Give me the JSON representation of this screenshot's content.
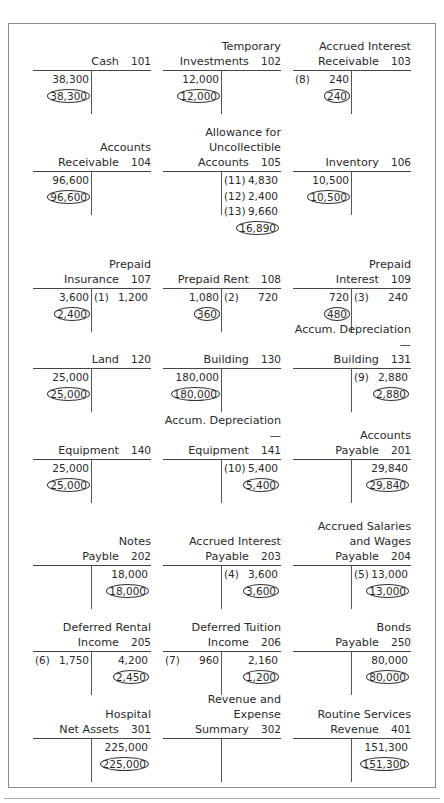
{
  "accounts": [
    {
      "name": "Cash",
      "number": "101",
      "debits": [
        {
          "ref": "",
          "amount": "38,300"
        }
      ],
      "credits": [],
      "balance": {
        "side": "debit",
        "amount": "38,300"
      }
    },
    {
      "name": "Temporary\nInvestments",
      "number": "102",
      "debits": [
        {
          "ref": "",
          "amount": "12,000"
        }
      ],
      "credits": [],
      "balance": {
        "side": "debit",
        "amount": "12,000"
      }
    },
    {
      "name": "Accrued Interest\nReceivable",
      "number": "103",
      "debits": [
        {
          "ref": "(8)",
          "amount": "240"
        }
      ],
      "credits": [],
      "balance": {
        "side": "debit",
        "amount": "240"
      }
    },
    {
      "name": "Accounts\nReceivable",
      "number": "104",
      "debits": [
        {
          "ref": "",
          "amount": "96,600"
        }
      ],
      "credits": [],
      "balance": {
        "side": "debit",
        "amount": "96,600"
      }
    },
    {
      "name": "Allowance for\nUncollectible\nAccounts",
      "number": "105",
      "debits": [],
      "credits": [
        {
          "ref": "(11)",
          "amount": "4,830"
        },
        {
          "ref": "(12)",
          "amount": "2,400"
        },
        {
          "ref": "(13)",
          "amount": "9,660"
        }
      ],
      "balance": {
        "side": "credit",
        "amount": "16,890"
      }
    },
    {
      "name": "Inventory",
      "number": "106",
      "debits": [
        {
          "ref": "",
          "amount": "10,500"
        }
      ],
      "credits": [],
      "balance": {
        "side": "debit",
        "amount": "10,500"
      }
    },
    {
      "name": "Prepaid\nInsurance",
      "number": "107",
      "debits": [
        {
          "ref": "",
          "amount": "3,600"
        }
      ],
      "credits": [
        {
          "ref": "(1)",
          "amount": "1,200"
        }
      ],
      "balance": {
        "side": "debit",
        "amount": "2,400"
      }
    },
    {
      "name": "Prepaid Rent",
      "number": "108",
      "debits": [
        {
          "ref": "",
          "amount": "1,080"
        }
      ],
      "credits": [
        {
          "ref": "(2)",
          "amount": "720"
        }
      ],
      "balance": {
        "side": "debit",
        "amount": "360"
      }
    },
    {
      "name": "Prepaid\nInterest",
      "number": "109",
      "debits": [
        {
          "ref": "",
          "amount": "720"
        }
      ],
      "credits": [
        {
          "ref": "(3)",
          "amount": "240"
        }
      ],
      "balance": {
        "side": "debit",
        "amount": "480"
      }
    },
    {
      "name": "Land",
      "number": "120",
      "debits": [
        {
          "ref": "",
          "amount": "25,000"
        }
      ],
      "credits": [],
      "balance": {
        "side": "debit",
        "amount": "25,000"
      }
    },
    {
      "name": "Building",
      "number": "130",
      "debits": [
        {
          "ref": "",
          "amount": "180,000"
        }
      ],
      "credits": [],
      "balance": {
        "side": "debit",
        "amount": "180,000"
      }
    },
    {
      "name": "Accum. Depreciation—\nBuilding",
      "number": "131",
      "debits": [],
      "credits": [
        {
          "ref": "(9)",
          "amount": "2,880"
        }
      ],
      "balance": {
        "side": "credit",
        "amount": "2,880"
      }
    },
    {
      "name": "Equipment",
      "number": "140",
      "debits": [
        {
          "ref": "",
          "amount": "25,000"
        }
      ],
      "credits": [],
      "balance": {
        "side": "debit",
        "amount": "25,000"
      }
    },
    {
      "name": "Accum. Depreciation—\nEquipment",
      "number": "141",
      "debits": [],
      "credits": [
        {
          "ref": "(10)",
          "amount": "5,400"
        }
      ],
      "balance": {
        "side": "credit",
        "amount": "5,400"
      }
    },
    {
      "name": "Accounts\nPayable",
      "number": "201",
      "debits": [],
      "credits": [
        {
          "ref": "",
          "amount": "29,840"
        }
      ],
      "balance": {
        "side": "credit",
        "amount": "29,840"
      }
    },
    {
      "name": "Notes\nPayble",
      "number": "202",
      "debits": [],
      "credits": [
        {
          "ref": "",
          "amount": "18,000"
        }
      ],
      "balance": {
        "side": "credit",
        "amount": "18,000"
      }
    },
    {
      "name": "Accrued Interest\nPayable",
      "number": "203",
      "debits": [],
      "credits": [
        {
          "ref": "(4)",
          "amount": "3,600"
        }
      ],
      "balance": {
        "side": "credit",
        "amount": "3,600"
      }
    },
    {
      "name": "Accrued Salaries\nand Wages\nPayable",
      "number": "204",
      "debits": [],
      "credits": [
        {
          "ref": "(5)",
          "amount": "13,000"
        }
      ],
      "balance": {
        "side": "credit",
        "amount": "13,000"
      }
    },
    {
      "name": "Deferred Rental\nIncome",
      "number": "205",
      "debits": [
        {
          "ref": "(6)",
          "amount": "1,750"
        }
      ],
      "credits": [
        {
          "ref": "",
          "amount": "4,200"
        }
      ],
      "balance": {
        "side": "credit",
        "amount": "2,450"
      }
    },
    {
      "name": "Deferred Tuition\nIncome",
      "number": "206",
      "debits": [
        {
          "ref": "(7)",
          "amount": "960"
        }
      ],
      "credits": [
        {
          "ref": "",
          "amount": "2,160"
        }
      ],
      "balance": {
        "side": "credit",
        "amount": "1,200"
      }
    },
    {
      "name": "Bonds\nPayable",
      "number": "250",
      "debits": [],
      "credits": [
        {
          "ref": "",
          "amount": "80,000"
        }
      ],
      "balance": {
        "side": "credit",
        "amount": "80,000"
      }
    },
    {
      "name": "Hospital\nNet Assets",
      "number": "301",
      "debits": [],
      "credits": [
        {
          "ref": "",
          "amount": "225,000"
        }
      ],
      "balance": {
        "side": "credit",
        "amount": "225,000"
      }
    },
    {
      "name": "Revenue and Expense\nSummary",
      "number": "302",
      "debits": [],
      "credits": [],
      "balance": null
    },
    {
      "name": "Routine Services\nRevenue",
      "number": "401",
      "debits": [],
      "credits": [
        {
          "ref": "",
          "amount": "151,300"
        }
      ],
      "balance": {
        "side": "credit",
        "amount": "151,300"
      }
    }
  ]
}
